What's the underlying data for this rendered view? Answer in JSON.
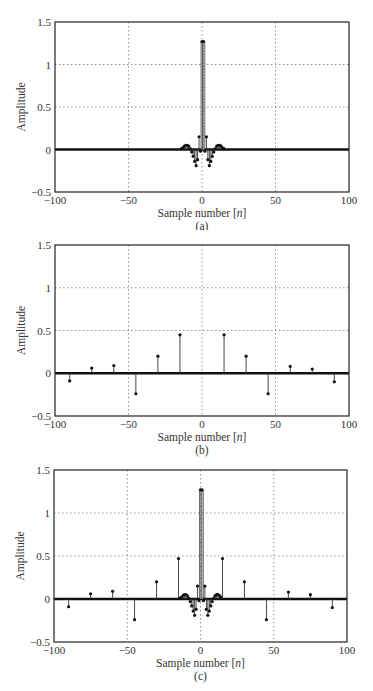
{
  "chart_data": [
    {
      "type": "stem",
      "panel_label": "(a)",
      "title": "",
      "xlabel": "Sample number [n]",
      "ylabel": "Amplitude",
      "xlim": [
        -100,
        100
      ],
      "ylim": [
        -0.5,
        1.5
      ],
      "xticks": [
        -100,
        -50,
        0,
        50,
        100
      ],
      "yticks": [
        -0.5,
        0,
        0.5,
        1,
        1.5
      ],
      "xtick_labels": [
        "−100",
        "−50",
        "0",
        "50",
        "100"
      ],
      "ytick_labels": [
        "−0.5",
        "0",
        "0.5",
        "1",
        "1.5"
      ],
      "grid": true,
      "description": "Sinc-like pulse: two central samples at ~1.27, small decaying sidelobes, near-zero elsewhere (every integer n from -100 to 100).",
      "points": [
        [
          -14,
          0.01
        ],
        [
          -13,
          0.02
        ],
        [
          -12,
          0.04
        ],
        [
          -11,
          0.05
        ],
        [
          -10,
          0.05
        ],
        [
          -9,
          0.04
        ],
        [
          -8,
          0.01
        ],
        [
          -7,
          -0.03
        ],
        [
          -6,
          -0.08
        ],
        [
          -5,
          -0.14
        ],
        [
          -4,
          -0.19
        ],
        [
          -3,
          -0.12
        ],
        [
          -2,
          0.15
        ],
        [
          -1,
          -0.02
        ],
        [
          0,
          1.27
        ],
        [
          1,
          1.27
        ],
        [
          2,
          -0.02
        ],
        [
          3,
          0.15
        ],
        [
          4,
          -0.12
        ],
        [
          5,
          -0.19
        ],
        [
          6,
          -0.14
        ],
        [
          7,
          -0.08
        ],
        [
          8,
          -0.03
        ],
        [
          9,
          0.01
        ],
        [
          10,
          0.04
        ],
        [
          11,
          0.05
        ],
        [
          12,
          0.05
        ],
        [
          13,
          0.04
        ],
        [
          14,
          0.02
        ],
        [
          15,
          0.01
        ]
      ],
      "baseline_fill": 0.0
    },
    {
      "type": "stem",
      "panel_label": "(b)",
      "title": "",
      "xlabel": "Sample number [n]",
      "ylabel": "Amplitude",
      "xlim": [
        -100,
        100
      ],
      "ylim": [
        -0.5,
        1.5
      ],
      "xticks": [
        -100,
        -50,
        0,
        50,
        100
      ],
      "yticks": [
        -0.5,
        0,
        0.5,
        1,
        1.5
      ],
      "xtick_labels": [
        "−100",
        "−50",
        "0",
        "50",
        "100"
      ],
      "ytick_labels": [
        "−0.5",
        "0",
        "0.5",
        "1",
        "1.5"
      ],
      "grid": true,
      "description": "Sparse stems every 15 samples; zero at all other n.",
      "points": [
        [
          -90,
          -0.09
        ],
        [
          -75,
          0.06
        ],
        [
          -60,
          0.09
        ],
        [
          -45,
          -0.24
        ],
        [
          -30,
          0.2
        ],
        [
          -15,
          0.45
        ],
        [
          15,
          0.45
        ],
        [
          30,
          0.2
        ],
        [
          45,
          -0.24
        ],
        [
          60,
          0.08
        ],
        [
          75,
          0.05
        ],
        [
          90,
          -0.1
        ]
      ],
      "baseline_fill": 0.0
    },
    {
      "type": "stem",
      "panel_label": "(c)",
      "title": "",
      "xlabel": "Sample number [n]",
      "ylabel": "Amplitude",
      "xlim": [
        -100,
        100
      ],
      "ylim": [
        -0.5,
        1.5
      ],
      "xticks": [
        -100,
        -50,
        0,
        50,
        100
      ],
      "yticks": [
        -0.5,
        0,
        0.5,
        1,
        1.5
      ],
      "xtick_labels": [
        "−100",
        "−50",
        "0",
        "50",
        "100"
      ],
      "ytick_labels": [
        "−0.5",
        "0",
        "0.5",
        "1",
        "1.5"
      ],
      "grid": true,
      "description": "Sum of (a) and (b).",
      "points": [
        [
          -90,
          -0.09
        ],
        [
          -75,
          0.06
        ],
        [
          -60,
          0.09
        ],
        [
          -45,
          -0.24
        ],
        [
          -30,
          0.2
        ],
        [
          -15,
          0.47
        ],
        [
          -14,
          0.01
        ],
        [
          -13,
          0.02
        ],
        [
          -12,
          0.04
        ],
        [
          -11,
          0.05
        ],
        [
          -10,
          0.05
        ],
        [
          -9,
          0.04
        ],
        [
          -8,
          0.01
        ],
        [
          -7,
          -0.03
        ],
        [
          -6,
          -0.08
        ],
        [
          -5,
          -0.14
        ],
        [
          -4,
          -0.19
        ],
        [
          -3,
          -0.12
        ],
        [
          -2,
          0.15
        ],
        [
          -1,
          -0.02
        ],
        [
          0,
          1.27
        ],
        [
          1,
          1.27
        ],
        [
          2,
          -0.02
        ],
        [
          3,
          0.15
        ],
        [
          4,
          -0.12
        ],
        [
          5,
          -0.19
        ],
        [
          6,
          -0.14
        ],
        [
          7,
          -0.08
        ],
        [
          8,
          -0.03
        ],
        [
          9,
          0.01
        ],
        [
          10,
          0.04
        ],
        [
          11,
          0.05
        ],
        [
          12,
          0.05
        ],
        [
          13,
          0.04
        ],
        [
          14,
          0.02
        ],
        [
          15,
          0.47
        ],
        [
          30,
          0.2
        ],
        [
          45,
          -0.24
        ],
        [
          60,
          0.08
        ],
        [
          75,
          0.05
        ],
        [
          90,
          -0.1
        ]
      ],
      "baseline_fill": 0.0
    }
  ],
  "panels": [
    {
      "caption": "(a)",
      "xlabel": "Sample number [n]",
      "ylabel": "Amplitude"
    },
    {
      "caption": "(b)",
      "xlabel": "Sample number [n]",
      "ylabel": "Amplitude"
    },
    {
      "caption": "(c)",
      "xlabel": "Sample number [n]",
      "ylabel": "Amplitude"
    }
  ],
  "colors": {
    "axis": "#222222",
    "grid": "#777777",
    "stem": "#333333",
    "marker": "#111111",
    "baseline": "#111111"
  }
}
